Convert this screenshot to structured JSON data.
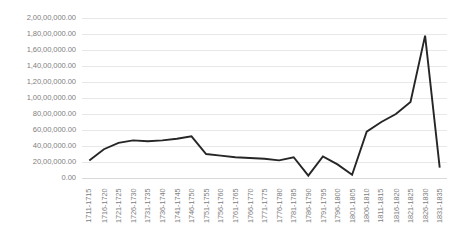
{
  "chart_data": {
    "type": "line",
    "title": "",
    "xlabel": "",
    "ylabel": "",
    "categories": [
      "1711-1715",
      "1716-1720",
      "1721-1725",
      "1726-1730",
      "1731-1735",
      "1736-1740",
      "1741-1745",
      "1746-1750",
      "1751-1755",
      "1756-1760",
      "1761-1765",
      "1766-1770",
      "1771-1775",
      "1776-1780",
      "1781-1785",
      "1786-1790",
      "1791-1795",
      "1796-1800",
      "1801-1805",
      "1806-1810",
      "1811-1815",
      "1816-1820",
      "1821-1825",
      "1826-1830",
      "1831-1835"
    ],
    "values": [
      2200000,
      3600000,
      4400000,
      4700000,
      4600000,
      4700000,
      4900000,
      5200000,
      3000000,
      2800000,
      2600000,
      2500000,
      2400000,
      2200000,
      2600000,
      300000,
      2700000,
      1700000,
      400000,
      5800000,
      7000000,
      8000000,
      9500000,
      17800000,
      1300000
    ],
    "ylim": [
      0,
      20000000
    ],
    "ytick_values": [
      0,
      2000000,
      4000000,
      6000000,
      8000000,
      10000000,
      12000000,
      14000000,
      16000000,
      18000000,
      20000000
    ],
    "ytick_labels": [
      "0.00",
      "20,00,000.00",
      "40,00,000.00",
      "60,00,000.00",
      "80,00,000.00",
      "1,00,00,000.00",
      "1,20,00,000.00",
      "1,40,00,000.00",
      "1,60,00,000.00",
      "1,80,00,000.00",
      "2,00,00,000.00"
    ],
    "grid": true,
    "legend": false,
    "legend_position": "none",
    "series": [
      {
        "name": "Series 1",
        "color": "#262626",
        "values": [
          2200000,
          3600000,
          4400000,
          4700000,
          4600000,
          4700000,
          4900000,
          5200000,
          3000000,
          2800000,
          2600000,
          2500000,
          2400000,
          2200000,
          2600000,
          300000,
          2700000,
          1700000,
          400000,
          5800000,
          7000000,
          8000000,
          9500000,
          17800000,
          1300000
        ]
      }
    ]
  }
}
